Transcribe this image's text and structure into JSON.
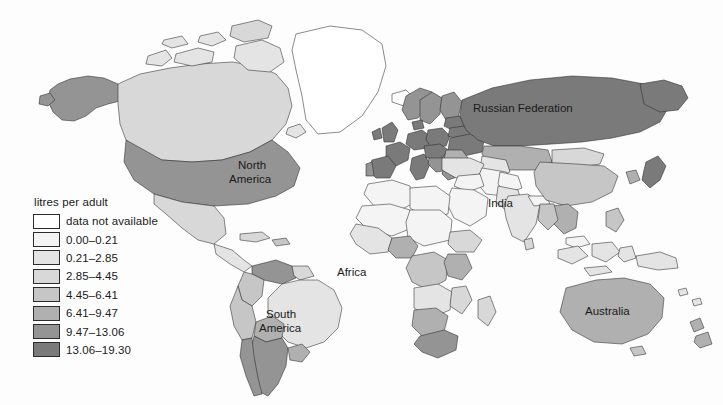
{
  "chart_data": {
    "type": "map",
    "title": "",
    "subtitle": "",
    "map_kind": "choropleth world map",
    "legend_title": "litres per adult",
    "unit": "litres per adult",
    "legend_position": "left-center",
    "grid": false,
    "classes": [
      {
        "label": "data not available",
        "color": "#ffffff",
        "min": null,
        "max": null
      },
      {
        "label": "0.00–0.21",
        "color": "#f4f4f4",
        "min": 0.0,
        "max": 0.21
      },
      {
        "label": "0.21–2.85",
        "color": "#e4e4e4",
        "min": 0.21,
        "max": 2.85
      },
      {
        "label": "2.85–4.45",
        "color": "#d8d8d8",
        "min": 2.85,
        "max": 4.45
      },
      {
        "label": "4.45–6.41",
        "color": "#c6c6c6",
        "min": 4.45,
        "max": 6.41
      },
      {
        "label": "6.41–9.47",
        "color": "#b0b0b0",
        "min": 6.41,
        "max": 9.47
      },
      {
        "label": "9.47–13.06",
        "color": "#949494",
        "min": 9.47,
        "max": 13.06
      },
      {
        "label": "13.06–19.30",
        "color": "#7a7a7a",
        "min": 13.06,
        "max": 19.3
      }
    ],
    "value_range": [
      0.0,
      19.3
    ],
    "map_labels": [
      {
        "name": "North America",
        "lines": [
          "North",
          "America"
        ],
        "x": 258,
        "y": 167
      },
      {
        "name": "South America",
        "lines": [
          "South",
          "America"
        ],
        "x": 286,
        "y": 318
      },
      {
        "name": "Africa",
        "lines": [
          "Africa"
        ],
        "x": 358,
        "y": 272
      },
      {
        "name": "India",
        "lines": [
          "India"
        ],
        "x": 501,
        "y": 203
      },
      {
        "name": "Russian Federation",
        "lines": [
          "Russian Federation"
        ],
        "x": 525,
        "y": 108
      },
      {
        "name": "Australia",
        "lines": [
          "Australia"
        ],
        "x": 611,
        "y": 312
      }
    ]
  },
  "legend": {
    "title": "litres per adult",
    "rows": [
      {
        "label": "data not available",
        "color": "#ffffff"
      },
      {
        "label": "0.00–0.21",
        "color": "#f4f4f4"
      },
      {
        "label": "0.21–2.85",
        "color": "#e4e4e4"
      },
      {
        "label": "2.85–4.45",
        "color": "#d8d8d8"
      },
      {
        "label": "4.45–6.41",
        "color": "#c6c6c6"
      },
      {
        "label": "6.41–9.47",
        "color": "#b0b0b0"
      },
      {
        "label": "9.47–13.06",
        "color": "#949494"
      },
      {
        "label": "13.06–19.30",
        "color": "#7a7a7a"
      }
    ]
  },
  "labels": {
    "north_america": "North",
    "north_america2": "America",
    "south_america": "South",
    "south_america2": "America",
    "africa": "Africa",
    "india": "India",
    "russia": "Russian Federation",
    "australia": "Australia"
  }
}
